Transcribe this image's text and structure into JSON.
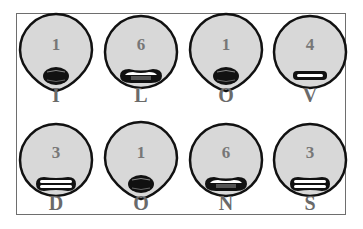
{
  "colors": {
    "face_fill": "#d8d8d8",
    "outline": "#111111",
    "mouth_dark": "#111111",
    "mouth_teeth": "#ffffff",
    "mouth_tongue": "#555555",
    "label": "#6a6a6a",
    "number": "#777777",
    "frame": "#6e6e6e"
  },
  "faces": [
    {
      "letter": "I",
      "number": "1",
      "mouth": "round-open",
      "shape": "drop"
    },
    {
      "letter": "L",
      "number": "6",
      "mouth": "wide-tongue"
    },
    {
      "letter": "O",
      "number": "1",
      "mouth": "round-open",
      "shape": "drop"
    },
    {
      "letter": "V",
      "number": "4",
      "mouth": "flat-teeth"
    },
    {
      "letter": "D",
      "number": "3",
      "mouth": "wide-teeth"
    },
    {
      "letter": "O",
      "number": "1",
      "mouth": "round-open",
      "shape": "drop"
    },
    {
      "letter": "N",
      "number": "6",
      "mouth": "wide-tongue"
    },
    {
      "letter": "S",
      "number": "3",
      "mouth": "wide-teeth"
    }
  ]
}
